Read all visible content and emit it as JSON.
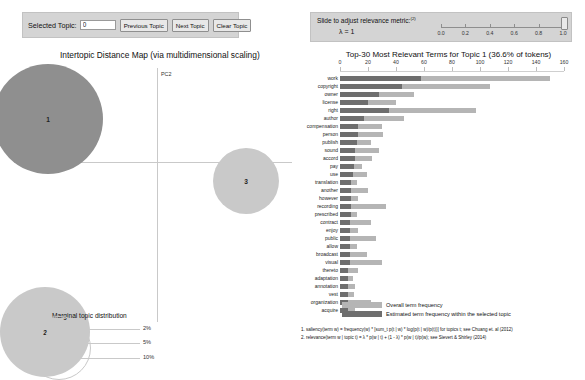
{
  "controls": {
    "selected_topic_label": "Selected Topic:",
    "selected_topic_value": "0",
    "previous_topic": "Previous Topic",
    "next_topic": "Next Topic",
    "clear_topic": "Clear Topic"
  },
  "slider": {
    "title": "Slide to adjust relevance metric:",
    "footnote_marker": "(2)",
    "lambda_text": "λ = 1",
    "value": 1.0,
    "ticks": [
      "0.0",
      "0.2",
      "0.4",
      "0.6",
      "0.8",
      "1.0"
    ]
  },
  "map": {
    "title": "Intertopic Distance Map (via multidimensional scaling)",
    "axis_x_label": "PC1",
    "axis_y_label": "PC2",
    "marginal_title": "Marginal topic distribution",
    "legend_sizes": [
      "2%",
      "5%",
      "10%"
    ],
    "topics": [
      {
        "id": "1",
        "cx": 48,
        "cy": 75,
        "r": 55,
        "selected": true
      },
      {
        "id": "3",
        "cx": 246,
        "cy": 137,
        "r": 33,
        "selected": false
      },
      {
        "id": "2",
        "cx": 45,
        "cy": 288,
        "r": 45,
        "selected": false
      }
    ],
    "colors": {
      "selected": "#8f8f8f",
      "unselected": "#c9c9c9"
    }
  },
  "barchart": {
    "title": "Top-30 Most Relevant Terms for Topic 1 (36.6% of tokens)",
    "legend_total": "Overall term frequency",
    "legend_selected": "Estimated term frequency within the selected topic",
    "footnote1": "1. saliency(term w) = frequency(w) * [sum_t p(t | w) * log(p(t | w)/p(t))] for topics t; see Chuang et. al (2012)",
    "footnote2": "2. relevance(term w | topic t) = λ * p(w | t) + (1 - λ) * p(w | t)/p(w); see Sievert & Shirley (2014)",
    "colors": {
      "total": "#b5b5b5",
      "selected": "#6e6e6e"
    }
  },
  "chart_data": {
    "type": "bar",
    "title": "Top-30 Most Relevant Terms for Topic 1 (36.6% of tokens)",
    "xlabel": "",
    "ylabel": "",
    "xlim": [
      0,
      160
    ],
    "xticks": [
      0,
      20,
      40,
      60,
      80,
      100,
      120,
      140,
      160
    ],
    "grid": false,
    "legend_position": "bottom",
    "categories": [
      "work",
      "copyright",
      "owner",
      "license",
      "right",
      "author",
      "compensation",
      "person",
      "publish",
      "sound",
      "accord",
      "pay",
      "use",
      "translation",
      "another",
      "however",
      "recording",
      "prescribed",
      "contract",
      "enjoy",
      "public",
      "allow",
      "broadcast",
      "visual",
      "thereto",
      "adaptation",
      "annotation",
      "vest",
      "organization",
      "acquire"
    ],
    "series": [
      {
        "name": "Overall term frequency",
        "values": [
          150,
          107,
          53,
          40,
          97,
          46,
          30,
          31,
          22,
          28,
          23,
          16,
          19,
          12,
          20,
          13,
          33,
          12,
          22,
          13,
          26,
          12,
          19,
          30,
          13,
          9,
          11,
          10,
          22,
          11
        ]
      },
      {
        "name": "Estimated term frequency within the selected topic",
        "values": [
          58,
          44,
          28,
          20,
          35,
          17,
          13,
          13,
          12,
          11,
          11,
          10,
          9,
          8,
          8,
          8,
          8,
          8,
          7,
          7,
          7,
          7,
          7,
          7,
          6,
          6,
          6,
          6,
          6,
          6
        ]
      }
    ]
  }
}
